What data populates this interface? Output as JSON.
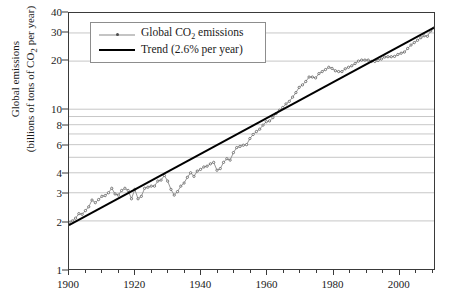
{
  "chart_data": {
    "type": "line",
    "title": "",
    "xlabel": "",
    "ylabel_line1": "Global emissions",
    "ylabel_line2": "(billions of tons of CO₂ per year)",
    "yscale": "log",
    "ylim": [
      1,
      40
    ],
    "xlim": [
      1900,
      2011
    ],
    "grid": true,
    "legend_position": "top-left",
    "ytick_labels": [
      "40",
      "30",
      "20",
      "10",
      "8",
      "6",
      "4",
      "3",
      "2",
      "1"
    ],
    "ytick_values": [
      40,
      30,
      20,
      10,
      8,
      6,
      4,
      3,
      2,
      1
    ],
    "gridline_values": [
      40,
      30,
      20,
      10,
      9,
      8,
      7,
      6,
      5,
      4,
      3,
      2,
      1
    ],
    "xtick_labels": [
      "1900",
      "1920",
      "1940",
      "1960",
      "1980",
      "2000"
    ],
    "xtick_values": [
      1900,
      1920,
      1940,
      1960,
      1980,
      2000
    ],
    "xminor_step": 5,
    "series": [
      {
        "name": "Global CO₂ emissions",
        "color": "#8a8a8a",
        "marker_color": "#4d4d4d",
        "x": [
          1900,
          1901,
          1902,
          1903,
          1904,
          1905,
          1906,
          1907,
          1908,
          1909,
          1910,
          1911,
          1912,
          1913,
          1914,
          1915,
          1916,
          1917,
          1918,
          1919,
          1920,
          1921,
          1922,
          1923,
          1924,
          1925,
          1926,
          1927,
          1928,
          1929,
          1930,
          1931,
          1932,
          1933,
          1934,
          1935,
          1936,
          1937,
          1938,
          1939,
          1940,
          1941,
          1942,
          1943,
          1944,
          1945,
          1946,
          1947,
          1948,
          1949,
          1950,
          1951,
          1952,
          1953,
          1954,
          1955,
          1956,
          1957,
          1958,
          1959,
          1960,
          1961,
          1962,
          1963,
          1964,
          1965,
          1966,
          1967,
          1968,
          1969,
          1970,
          1971,
          1972,
          1973,
          1974,
          1975,
          1976,
          1977,
          1978,
          1979,
          1980,
          1981,
          1982,
          1983,
          1984,
          1985,
          1986,
          1987,
          1988,
          1989,
          1990,
          1991,
          1992,
          1993,
          1994,
          1995,
          1996,
          1997,
          1998,
          1999,
          2000,
          2001,
          2002,
          2003,
          2004,
          2005,
          2006,
          2007,
          2008,
          2009,
          2010,
          2011
        ],
        "y": [
          1.95,
          2.0,
          2.08,
          2.22,
          2.2,
          2.32,
          2.45,
          2.7,
          2.6,
          2.72,
          2.85,
          2.88,
          3.0,
          3.2,
          2.95,
          2.9,
          3.1,
          3.2,
          3.1,
          2.75,
          3.15,
          2.75,
          2.85,
          3.2,
          3.25,
          3.3,
          3.3,
          3.55,
          3.6,
          3.85,
          3.55,
          3.15,
          2.9,
          3.05,
          3.3,
          3.45,
          3.75,
          4.0,
          3.8,
          4.1,
          4.2,
          4.35,
          4.4,
          4.55,
          4.65,
          4.15,
          4.25,
          4.65,
          4.9,
          4.8,
          5.35,
          5.75,
          5.85,
          5.95,
          6.0,
          6.55,
          6.95,
          7.25,
          7.5,
          7.95,
          8.35,
          8.45,
          8.85,
          9.4,
          9.85,
          10.25,
          10.8,
          11.2,
          11.9,
          12.7,
          13.7,
          14.2,
          14.9,
          15.9,
          15.9,
          15.7,
          16.7,
          17.2,
          17.7,
          18.3,
          18.0,
          17.4,
          17.2,
          17.2,
          17.9,
          18.3,
          18.7,
          19.3,
          20.0,
          20.3,
          20.3,
          20.3,
          19.9,
          19.9,
          20.2,
          20.6,
          21.2,
          21.3,
          21.3,
          21.4,
          22.0,
          22.4,
          22.8,
          24.0,
          25.2,
          26.1,
          27.0,
          28.0,
          28.8,
          28.6,
          30.9,
          32.3
        ]
      },
      {
        "name": "Trend (2.6% per year)",
        "color": "#000000",
        "type": "trend",
        "rate_percent": 2.6,
        "x": [
          1900,
          2011
        ],
        "y": [
          1.88,
          32.4
        ]
      }
    ],
    "legend": [
      {
        "label": "Global CO₂ emissions",
        "key": "series"
      },
      {
        "label": "Trend (2.6% per year)",
        "key": "trend"
      }
    ]
  },
  "legend": {
    "item1_prefix": "Global CO",
    "item1_sub": "2",
    "item1_suffix": " emissions",
    "item2": "Trend (2.6% per year)"
  },
  "axes": {
    "y_title_line1": "Global emissions",
    "y_title_line2_prefix": "(billions of tons of CO",
    "y_title_line2_sub": "2",
    "y_title_line2_suffix": " per year)"
  }
}
